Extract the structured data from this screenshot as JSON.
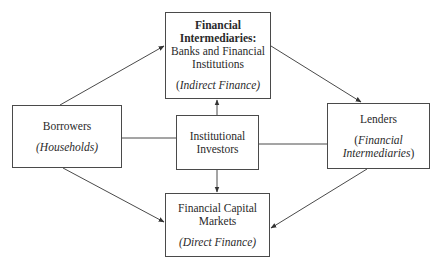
{
  "nodes": {
    "intermediaries": {
      "title_line1": "Financial",
      "title_line2": "Intermediaries:",
      "body_line1": "Banks and Financial",
      "body_line2": "Institutions",
      "note_open": "(",
      "note_italic": "Indirect Finance)",
      "note_close": ""
    },
    "borrowers": {
      "label": "Borrowers",
      "note": "(Households)"
    },
    "institutional": {
      "line1": "Institutional",
      "line2": "Investors"
    },
    "lenders": {
      "label": "Lenders",
      "note_open": "(",
      "note_line1": "Financial",
      "note_line2": "Intermediaries",
      "note_close": ")"
    },
    "markets": {
      "line1": "Financial Capital",
      "line2": "Markets",
      "note": "(Direct Finance)"
    }
  },
  "edges": [
    {
      "from": "borrowers",
      "to": "intermediaries",
      "arrow": true
    },
    {
      "from": "intermediaries",
      "to": "lenders",
      "arrow": true
    },
    {
      "from": "institutional",
      "to": "intermediaries",
      "arrow": true
    },
    {
      "from": "institutional",
      "to": "markets",
      "arrow": true
    },
    {
      "from": "borrowers",
      "to": "markets",
      "arrow": true
    },
    {
      "from": "lenders",
      "to": "markets",
      "arrow": true
    },
    {
      "from": "borrowers",
      "to": "institutional",
      "arrow": false
    },
    {
      "from": "institutional",
      "to": "lenders",
      "arrow": false
    }
  ],
  "colors": {
    "line": "#4a4a4a",
    "text": "#2a2a2a",
    "background": "#ffffff"
  }
}
